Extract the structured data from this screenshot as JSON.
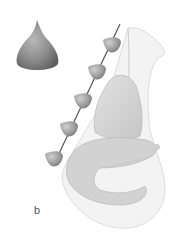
{
  "figure": {
    "panel_label": "b",
    "colors": {
      "background": "#ffffff",
      "barb": "#7a7a7a",
      "barb_highlight": "#b0b0b0",
      "nose_tissue": "#d4d4d4",
      "nose_outline": "#bdbdbd",
      "thread": "#555555"
    },
    "detail_barb": {
      "label": "single barb cone detail"
    },
    "barbs_count": 5
  }
}
